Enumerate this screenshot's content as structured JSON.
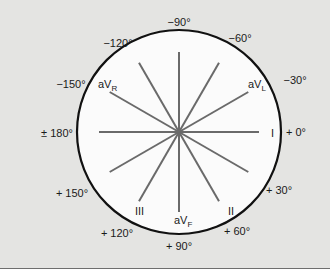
{
  "diagram": {
    "colors": {
      "background": "#e4e4e2",
      "circle_fill": "#fbfbfb",
      "circle_stroke": "#111111",
      "axis_lines": "#6a6a6a",
      "divider": "#6e6e6e"
    },
    "outer_angle_labels": [
      {
        "text": "−90°",
        "x": 179,
        "y": 26,
        "anchor": "middle"
      },
      {
        "text": "−60°",
        "x": 240,
        "y": 42,
        "anchor": "middle"
      },
      {
        "text": "−120°",
        "x": 118,
        "y": 47,
        "anchor": "middle"
      },
      {
        "text": "−30°",
        "x": 295,
        "y": 84,
        "anchor": "middle"
      },
      {
        "text": "−150°",
        "x": 71,
        "y": 88,
        "anchor": "middle"
      },
      {
        "text": "± 180°",
        "x": 57,
        "y": 137,
        "anchor": "middle"
      },
      {
        "text": "+ 0°",
        "x": 296,
        "y": 136,
        "anchor": "middle"
      },
      {
        "text": "+ 150°",
        "x": 72,
        "y": 197,
        "anchor": "middle"
      },
      {
        "text": "+ 30°",
        "x": 279,
        "y": 194,
        "anchor": "middle"
      },
      {
        "text": "+ 120°",
        "x": 117,
        "y": 237,
        "anchor": "middle"
      },
      {
        "text": "+ 60°",
        "x": 237,
        "y": 235,
        "anchor": "middle"
      },
      {
        "text": "+ 90°",
        "x": 179,
        "y": 250,
        "anchor": "middle"
      }
    ],
    "lead_labels": [
      {
        "text": "aV",
        "sub": "R",
        "x": 98,
        "y": 88
      },
      {
        "text": "aV",
        "sub": "L",
        "x": 248,
        "y": 88
      },
      {
        "text": "I",
        "sub": "",
        "x": 271,
        "y": 137
      },
      {
        "text": "III",
        "sub": "",
        "x": 135,
        "y": 215
      },
      {
        "text": "aV",
        "sub": "F",
        "x": 174,
        "y": 224
      },
      {
        "text": "II",
        "sub": "",
        "x": 228,
        "y": 215
      }
    ],
    "axis_angles_deg": [
      0,
      30,
      60,
      90,
      120,
      150,
      180,
      -30,
      -60,
      -90,
      -120,
      -150
    ],
    "center": {
      "x": 179,
      "y": 132
    },
    "circle_radius": 102,
    "spoke_length": 80
  }
}
